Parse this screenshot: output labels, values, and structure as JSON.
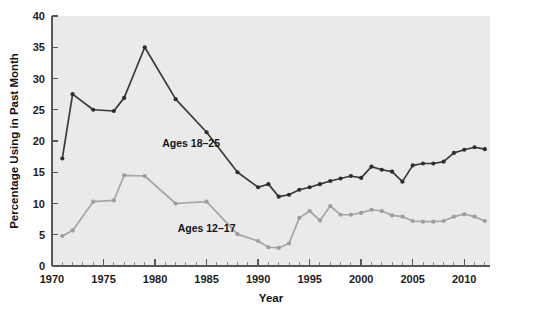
{
  "chart_data": {
    "type": "line",
    "title": "",
    "xlabel": "Year",
    "ylabel": "Percentage Using in Past Month",
    "xlim": [
      1970,
      2012.5
    ],
    "ylim": [
      0,
      40
    ],
    "xticks": [
      1970,
      1975,
      1980,
      1985,
      1990,
      1995,
      2000,
      2005,
      2010
    ],
    "yticks": [
      0,
      5,
      10,
      15,
      20,
      25,
      30,
      35,
      40
    ],
    "xtick_labels": [
      "1970",
      "1975",
      "1980",
      "1985",
      "1990",
      "1995",
      "2000",
      "2005",
      "2010"
    ],
    "ytick_labels": [
      "0",
      "5",
      "10",
      "15",
      "20",
      "25",
      "30",
      "35",
      "40"
    ],
    "minor_xticks_interval": 1,
    "grid": false,
    "legend_position": "inline-annotation",
    "plot_background": "#eaeaea",
    "series": [
      {
        "name": "Ages 18-25",
        "label": "Ages 18–25",
        "color": "#3a3a3c",
        "marker": "circle",
        "x": [
          1971,
          1972,
          1974,
          1976,
          1977,
          1979,
          1982,
          1985,
          1988,
          1990,
          1991,
          1992,
          1993,
          1994,
          1995,
          1996,
          1997,
          1998,
          1999,
          2000,
          2001,
          2002,
          2003,
          2004,
          2005,
          2006,
          2007,
          2008,
          2009,
          2010,
          2011,
          2012
        ],
        "values": [
          17.2,
          27.5,
          25.0,
          24.8,
          26.9,
          35.0,
          26.7,
          21.4,
          15.0,
          12.6,
          13.1,
          11.1,
          11.4,
          12.2,
          12.6,
          13.1,
          13.6,
          14.0,
          14.4,
          14.1,
          15.9,
          15.4,
          15.1,
          13.5,
          16.1,
          16.4,
          16.4,
          16.7,
          18.1,
          18.6,
          19.0,
          18.7
        ]
      },
      {
        "name": "Ages 12-17",
        "label": "Ages 12–17",
        "color": "#a6a6a8",
        "marker": "circle",
        "x": [
          1971,
          1972,
          1974,
          1976,
          1977,
          1979,
          1982,
          1985,
          1988,
          1990,
          1991,
          1992,
          1993,
          1994,
          1995,
          1996,
          1997,
          1998,
          1999,
          2000,
          2001,
          2002,
          2003,
          2004,
          2005,
          2006,
          2007,
          2008,
          2009,
          2010,
          2011,
          2012
        ],
        "values": [
          4.8,
          5.7,
          10.3,
          10.5,
          14.5,
          14.4,
          10.0,
          10.3,
          5.1,
          4.0,
          3.0,
          2.9,
          3.6,
          7.7,
          8.8,
          7.3,
          9.6,
          8.2,
          8.2,
          8.5,
          9.0,
          8.8,
          8.1,
          7.9,
          7.2,
          7.1,
          7.1,
          7.2,
          7.9,
          8.3,
          7.9,
          7.2
        ]
      }
    ],
    "annotations": [
      {
        "text": "Ages 18–25",
        "x_year": 1983.5,
        "y_value": 19.0
      },
      {
        "text": "Ages 12–17",
        "x_year": 1985.0,
        "y_value": 5.4
      }
    ]
  }
}
